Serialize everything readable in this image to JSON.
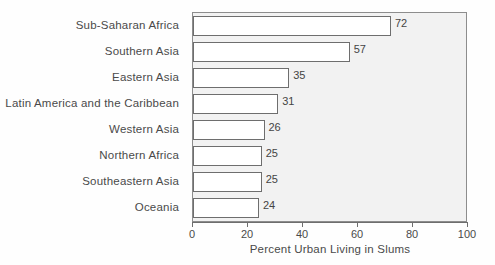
{
  "chart_data": {
    "type": "bar",
    "orientation": "horizontal",
    "title": "",
    "xlabel": "Percent Urban Living in Slums",
    "ylabel": "",
    "xlim": [
      0,
      100
    ],
    "xticks": [
      0,
      20,
      40,
      60,
      80,
      100
    ],
    "grid": false,
    "legend": null,
    "categories": [
      "Sub-Saharan Africa",
      "Southern Asia",
      "Eastern Asia",
      "Latin America and the Caribbean",
      "Western Asia",
      "Northern Africa",
      "Southeastern Asia",
      "Oceania"
    ],
    "values": [
      72,
      57,
      35,
      31,
      26,
      25,
      25,
      24
    ],
    "data_labels": [
      "72",
      "57",
      "35",
      "31",
      "26",
      "25",
      "25",
      "24"
    ],
    "colors": {
      "bar_fill": "#ffffff",
      "bar_edge": "#6e6e6e",
      "plot_background": "#f2f2f2",
      "frame": "#8d8d8d",
      "text": "#4a4a4a"
    }
  }
}
